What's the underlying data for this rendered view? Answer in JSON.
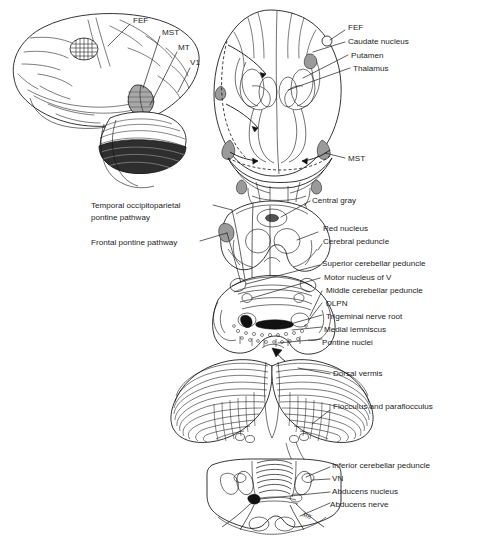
{
  "figure": {
    "background_color": "#ffffff",
    "line_color": "#111111",
    "text_color": "#1d1d1d",
    "accent_shade_color": "#9a9a9a",
    "signature": "MB"
  },
  "panels": {
    "lateral_cortex": {
      "name": "Lateral view of cerebral hemisphere",
      "labels": [
        {
          "id": "fef",
          "text": "FEF"
        },
        {
          "id": "mst",
          "text": "MST"
        },
        {
          "id": "mt",
          "text": "MT"
        },
        {
          "id": "v1",
          "text": "V1"
        }
      ]
    },
    "coronal_forebrain": {
      "name": "Coronal section through forebrain",
      "labels": [
        {
          "id": "fef2",
          "text": "FEF"
        },
        {
          "id": "caudate_nucleus",
          "text": "Caudate nucleus"
        },
        {
          "id": "putamen",
          "text": "Putamen"
        },
        {
          "id": "thalamus",
          "text": "Thalamus"
        },
        {
          "id": "mst2",
          "text": "MST"
        }
      ]
    },
    "midbrain": {
      "name": "Midbrain cross-section",
      "labels_left": [
        {
          "id": "top_pathway",
          "text": "Temporal occipitoparietal"
        },
        {
          "id": "top_pathway2",
          "text": "pontine pathway"
        },
        {
          "id": "frontal_pathway",
          "text": "Frontal pontine pathway"
        }
      ],
      "labels_right": [
        {
          "id": "central_gray",
          "text": "Central gray"
        },
        {
          "id": "red_nucleus",
          "text": "Red nucleus"
        },
        {
          "id": "cerebral_peduncle",
          "text": "Cerebral peduncle"
        }
      ]
    },
    "pons": {
      "name": "Pons cross-section",
      "labels_right": [
        {
          "id": "scp",
          "text": "Superior cerebellar peduncle"
        },
        {
          "id": "motor_nucleus_v",
          "text": "Motor nucleus of V"
        },
        {
          "id": "mcp",
          "text": "Middle cerebellar peduncle"
        },
        {
          "id": "dlpn",
          "text": "DLPN"
        },
        {
          "id": "trigeminal_root",
          "text": "Trigeminal nerve root"
        },
        {
          "id": "medial_lemniscus",
          "text": "Medial lemniscus"
        },
        {
          "id": "pontine_nuclei",
          "text": "Pontine nuclei"
        }
      ]
    },
    "cerebellum": {
      "name": "Dorsal view of cerebellum",
      "labels_right": [
        {
          "id": "dorsal_vermis",
          "text": "Dorsal vermis"
        },
        {
          "id": "flocculus",
          "text": "Flocculus and paraflocculus"
        }
      ]
    },
    "medulla": {
      "name": "Medulla / pontomedullary cross-section",
      "labels_right": [
        {
          "id": "icp",
          "text": "Inferior cerebellar peduncle"
        },
        {
          "id": "vn",
          "text": "VN"
        },
        {
          "id": "abducens_nucleus",
          "text": "Abducens nucleus"
        },
        {
          "id": "abducens_nerve",
          "text": "Abducens nerve"
        }
      ]
    }
  }
}
